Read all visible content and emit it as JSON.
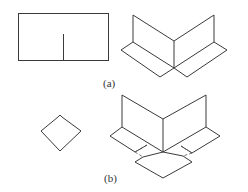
{
  "figure": {
    "panels": [
      {
        "id": "a",
        "label": "(a)",
        "description": "Rectangle with a slit from bottom edge to center, folded into a V-shaped corner with two base flaps"
      },
      {
        "id": "b",
        "label": "(b)",
        "description": "Small square diamond folded into a three-way corner with overlapping base flaps (dashed hidden lines)"
      }
    ],
    "colors": {
      "stroke": "#3a3a3a",
      "background": "#ffffff"
    }
  }
}
